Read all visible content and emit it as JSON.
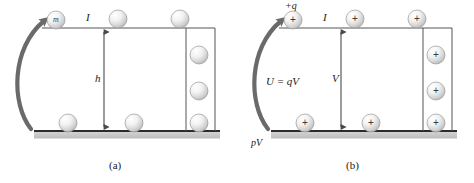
{
  "figure": {
    "background_color": "#ffffff",
    "line_color": "#2b2b2b",
    "arrow_color": "#6a6a6a",
    "ground_color": "#c9c9c9",
    "sphere_fill_light": "#fdfdfd",
    "sphere_fill_dark": "#bdbdbd",
    "sphere_stroke": "#9a9a9a",
    "text_color": "#1a1a1a"
  },
  "panel_a": {
    "caption": "(a)",
    "labels": {
      "mass": "m",
      "current": "I",
      "height": "h"
    },
    "spheres_top": [
      {
        "cx": 56,
        "cy": 20,
        "r": 9,
        "label": "m"
      },
      {
        "cx": 118,
        "cy": 19,
        "r": 9,
        "label": ""
      },
      {
        "cx": 180,
        "cy": 19,
        "r": 9,
        "label": ""
      }
    ],
    "spheres_bottom": [
      {
        "cx": 68,
        "cy": 127,
        "r": 9,
        "label": ""
      },
      {
        "cx": 134,
        "cy": 127,
        "r": 9,
        "label": ""
      },
      {
        "cx": 196,
        "cy": 127,
        "r": 9,
        "label": ""
      }
    ],
    "spheres_column": [
      {
        "cx": 196,
        "cy": 55,
        "r": 9,
        "label": ""
      },
      {
        "cx": 196,
        "cy": 91,
        "r": 9,
        "label": ""
      }
    ]
  },
  "panel_b": {
    "caption": "(b)",
    "labels": {
      "charge": "+q",
      "current": "I",
      "voltage": "V",
      "energy": "U = qV",
      "power": "pV"
    },
    "charges_top": [
      {
        "cx": 56,
        "cy": 20,
        "r": 9,
        "sign": "+"
      },
      {
        "cx": 118,
        "cy": 19,
        "r": 9,
        "sign": "+"
      },
      {
        "cx": 180,
        "cy": 19,
        "r": 9,
        "sign": "+"
      }
    ],
    "charges_bottom": [
      {
        "cx": 68,
        "cy": 127,
        "r": 9,
        "sign": "+"
      },
      {
        "cx": 134,
        "cy": 127,
        "r": 9,
        "sign": "+"
      },
      {
        "cx": 196,
        "cy": 127,
        "r": 9,
        "sign": "+"
      }
    ],
    "charges_column": [
      {
        "cx": 196,
        "cy": 55,
        "r": 9,
        "sign": "+"
      },
      {
        "cx": 196,
        "cy": 91,
        "r": 9,
        "sign": "+"
      }
    ]
  }
}
